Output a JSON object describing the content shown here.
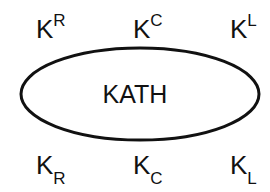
{
  "diagram": {
    "center_label": "KATH",
    "top_labels": [
      {
        "base": "K",
        "sup": "R"
      },
      {
        "base": "K",
        "sup": "C"
      },
      {
        "base": "K",
        "sup": "L"
      }
    ],
    "bottom_labels": [
      {
        "base": "K",
        "sub": "R"
      },
      {
        "base": "K",
        "sub": "C"
      },
      {
        "base": "K",
        "sub": "L"
      }
    ]
  }
}
